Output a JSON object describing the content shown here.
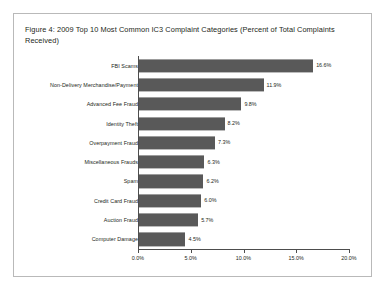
{
  "figure": {
    "title": "Figure 4: 2009 Top 10 Most Common IC3 Complaint Categories (Percent of Total Complaints Received)"
  },
  "colors": {
    "bar": "#595959",
    "axis": "#4d4d4d",
    "text": "#231f20",
    "frame_border": "#b9b9b9",
    "background": "#ffffff"
  },
  "chart_data": {
    "type": "bar",
    "orientation": "horizontal",
    "title": "Figure 4: 2009 Top 10 Most Common IC3 Complaint Categories (Percent of Total Complaints Received)",
    "xlabel": "",
    "ylabel": "",
    "xlim": [
      0,
      20
    ],
    "grid": false,
    "legend": false,
    "value_suffix": "%",
    "categories": [
      "FBI Scams",
      "Non-Delivery Merchandise/Payment",
      "Advanced Fee Fraud",
      "Identity Theft",
      "Overpayment Fraud",
      "Miscellaneous Frauds",
      "Spam",
      "Credit Card Fraud",
      "Auction Fraud",
      "Computer Damage"
    ],
    "values": [
      16.6,
      11.9,
      9.8,
      8.2,
      7.3,
      6.3,
      6.2,
      6.0,
      5.7,
      4.5
    ],
    "value_labels": [
      "16.6%",
      "11.9%",
      "9.8%",
      "8.2%",
      "7.3%",
      "6.3%",
      "6.2%",
      "6.0%",
      "5.7%",
      "4.5%"
    ],
    "xticks": [
      0,
      5,
      10,
      15,
      20
    ],
    "xtick_labels": [
      "0.0%",
      "5.0%",
      "10.0%",
      "15.0%",
      "20.0%"
    ]
  }
}
